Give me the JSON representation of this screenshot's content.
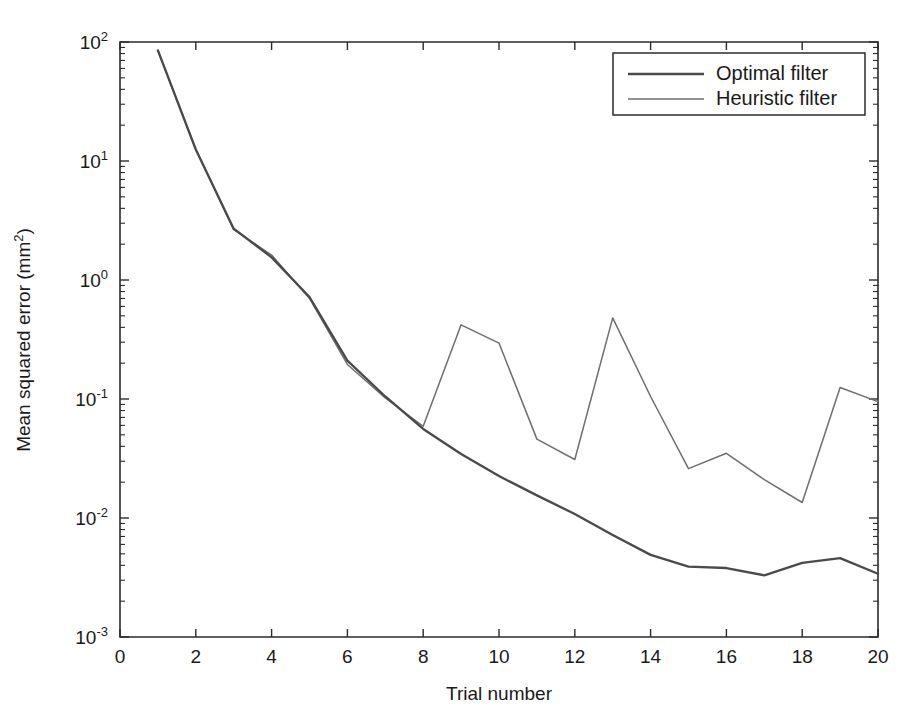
{
  "figure": {
    "background_color": "#ffffff",
    "width": 911,
    "height": 711
  },
  "chart_data": {
    "type": "line",
    "title": "",
    "xlabel": "Trial number",
    "ylabel": "Mean squared error (mm2)",
    "ylabel_display": "Mean squared error (mm",
    "ylabel_sup": "2",
    "ylabel_tail": ")",
    "yscale": "log",
    "xscale": "linear",
    "xlim": [
      0,
      20
    ],
    "ylim": [
      0.001,
      100
    ],
    "grid": false,
    "legend_position": "upper right",
    "xticks": [
      0,
      2,
      4,
      6,
      8,
      10,
      12,
      14,
      16,
      18,
      20
    ],
    "xticklabels": [
      "0",
      "2",
      "4",
      "6",
      "8",
      "10",
      "12",
      "14",
      "16",
      "18",
      "20"
    ],
    "yticks": [
      0.001,
      0.01,
      0.1,
      1,
      10,
      100
    ],
    "yticklabels": [
      "10-3",
      "10-2",
      "10-1",
      "100",
      "101",
      "102"
    ],
    "ytick_bases": [
      "10",
      "10",
      "10",
      "10",
      "10",
      "10"
    ],
    "ytick_exponents": [
      "-3",
      "-2",
      "-1",
      "0",
      "1",
      "2"
    ],
    "x": [
      1,
      2,
      3,
      4,
      5,
      6,
      7,
      8,
      9,
      10,
      11,
      12,
      13,
      14,
      15,
      16,
      17,
      18,
      19,
      20
    ],
    "series": [
      {
        "name": "Optimal filter",
        "color": "#4a4a4a",
        "linewidth": 2.3,
        "values": [
          85,
          12.5,
          2.7,
          1.55,
          0.72,
          0.21,
          0.105,
          0.056,
          0.0345,
          0.0225,
          0.0155,
          0.0108,
          0.0072,
          0.0049,
          0.0039,
          0.0038,
          0.0033,
          0.0042,
          0.0046,
          0.0034
        ]
      },
      {
        "name": "Heuristic filter",
        "color": "#6e6e6e",
        "linewidth": 1.5,
        "values": [
          85,
          12.5,
          2.65,
          1.62,
          0.7,
          0.195,
          0.102,
          0.059,
          0.42,
          0.295,
          0.046,
          0.031,
          0.48,
          0.105,
          0.026,
          0.035,
          0.021,
          0.0135,
          0.125,
          0.095
        ]
      }
    ]
  },
  "legend": {
    "entries": [
      {
        "label": "Optimal filter",
        "style": "solid-thick"
      },
      {
        "label": "Heuristic filter",
        "style": "solid-thin"
      }
    ]
  },
  "colors": {
    "axis": "#2b2b2b",
    "text": "#1a1a1a",
    "optimal": "#4a4a4a",
    "heuristic": "#6e6e6e",
    "background": "#ffffff"
  }
}
